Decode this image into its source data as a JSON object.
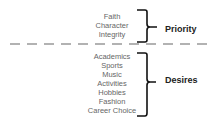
{
  "priority": {
    "label": "Priority",
    "items": [
      "Faith",
      "Character",
      "Integrity"
    ]
  },
  "desires": {
    "label": "Desires",
    "items": [
      "Academics",
      "Sports",
      "Music",
      "Activities",
      "Hobbies",
      "Fashion",
      "Career Choice"
    ]
  },
  "colors": {
    "item_text": "#666666",
    "label_text": "#222222",
    "brace": "#111111",
    "divider": "#999999"
  }
}
